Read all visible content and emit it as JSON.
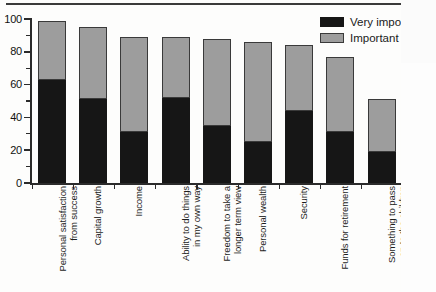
{
  "chart_data": {
    "type": "bar",
    "subtype": "stacked-vertical",
    "title": "",
    "xlabel": "",
    "ylabel": "",
    "ylim": [
      0,
      100
    ],
    "ytick_step": 20,
    "yticks": [
      0,
      20,
      40,
      60,
      80,
      100
    ],
    "ytick_labels": [
      "0",
      "20",
      "40",
      "60",
      "80",
      "100"
    ],
    "minor_ticks": true,
    "grid": false,
    "legend_position": "top-right",
    "categories": [
      "Personal satisfaction\nfrom success",
      "Capital growth",
      "Income",
      "Ability to do things\nin my own way",
      "Freedom to take a\nlonger term view",
      "Personal wealth",
      "Security",
      "Funds for retirement",
      "Something to pass\non to the children"
    ],
    "series": [
      {
        "name": "Very important",
        "color": "#161616",
        "values": [
          63,
          51,
          31,
          52,
          35,
          25,
          44,
          31,
          19
        ]
      },
      {
        "name": "Important",
        "color": "#9d9d9d",
        "values": [
          36,
          44,
          58,
          37,
          53,
          61,
          40,
          46,
          32
        ]
      }
    ],
    "totals": [
      99,
      95,
      89,
      89,
      88,
      86,
      84,
      77,
      51
    ]
  },
  "legend": {
    "items": [
      {
        "label": "Very impo",
        "full_label": "Very important",
        "swatch": "black-swatch"
      },
      {
        "label": "Important",
        "full_label": "Important",
        "swatch": "gray-swatch"
      }
    ]
  },
  "colors": {
    "very_important": "#161616",
    "important": "#9d9d9d",
    "axis": "#2b2b2b",
    "background": "#fdfdfc"
  }
}
